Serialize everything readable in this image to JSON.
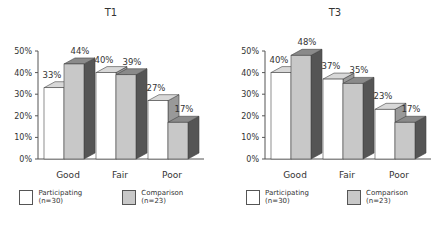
{
  "chart_data": [
    {
      "type": "bar",
      "title": "T1",
      "categories": [
        "Good",
        "Fair",
        "Poor"
      ],
      "series": [
        {
          "name": "Participating (n=30)",
          "values": [
            33,
            40,
            27
          ],
          "labels": [
            "33%",
            "40%",
            "27%"
          ]
        },
        {
          "name": "Comparison (n=23)",
          "values": [
            44,
            39,
            17
          ],
          "labels": [
            "44%",
            "39%",
            "17%"
          ]
        }
      ],
      "xlabel": "",
      "ylabel": "",
      "ylim": [
        0,
        50
      ],
      "yticks": [
        "0%",
        "10%",
        "20%",
        "30%",
        "40%",
        "50%"
      ],
      "style": "3d",
      "grid": false,
      "legend_position": "bottom"
    },
    {
      "type": "bar",
      "title": "T3",
      "categories": [
        "Good",
        "Fair",
        "Poor"
      ],
      "series": [
        {
          "name": "Participating (n=30)",
          "values": [
            40,
            37,
            23
          ],
          "labels": [
            "40%",
            "37%",
            "23%"
          ]
        },
        {
          "name": "Comparison (n=23)",
          "values": [
            48,
            35,
            17
          ],
          "labels": [
            "48%",
            "35%",
            "17%"
          ]
        }
      ],
      "xlabel": "",
      "ylabel": "",
      "ylim": [
        0,
        50
      ],
      "yticks": [
        "0%",
        "10%",
        "20%",
        "30%",
        "40%",
        "50%"
      ],
      "style": "3d",
      "grid": false,
      "legend_position": "bottom"
    }
  ],
  "colors": {
    "participating": "#ffffff",
    "comparison": "#c8c8c8",
    "comparison_side": "#555555",
    "comparison_top": "#8a8a8a",
    "participating_top": "#d8d8d8",
    "participating_side": "#999999",
    "axis": "#555555",
    "outline": "#444444"
  },
  "legend": {
    "participating": "Participating (n=30)",
    "comparison": "Comparison (n=23)"
  }
}
